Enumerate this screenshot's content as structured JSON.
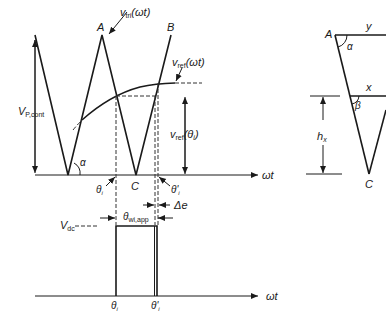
{
  "diagram": {
    "title": "",
    "colors": {
      "line": "#1a1a1a",
      "background": "#ffffff"
    },
    "top_plot": {
      "labels": {
        "carrier": "v",
        "carrier_sub": "tri",
        "carrier_arg": "(ωt)",
        "reference": "v",
        "reference_sub": "ref",
        "reference_arg": "(ωt)",
        "amplitude": "V",
        "amplitude_sub": "P,cont",
        "ref_at_theta": "v",
        "ref_at_theta_sub": "ref",
        "ref_at_theta_arg": "(θ",
        "ref_at_theta_arg_sub": "i",
        "ref_at_theta_close": ")",
        "peak_a": "A",
        "peak_b": "B",
        "valley_c": "C",
        "angle_alpha": "α",
        "theta_i": "θ",
        "theta_i_sub": "i",
        "theta_i_prime": "θ'",
        "theta_i_prime_sub": "i",
        "delta_e": "Δe",
        "axis": "ωt"
      }
    },
    "bottom_plot": {
      "labels": {
        "vdc": "V",
        "vdc_sub": "dc",
        "pulse_width": "θ",
        "pulse_width_sub": "wi,app",
        "theta_i": "θ",
        "theta_i_sub": "i",
        "theta_i_prime": "θ'",
        "theta_i_prime_sub": "i",
        "axis": "ωt"
      }
    },
    "triangle_detail": {
      "labels": {
        "vertex_a": "A",
        "vertex_c": "C",
        "top_width": "y",
        "mid_width": "x",
        "angle_alpha": "α",
        "angle_beta": "β",
        "height": "h",
        "height_sub": "x"
      }
    }
  }
}
